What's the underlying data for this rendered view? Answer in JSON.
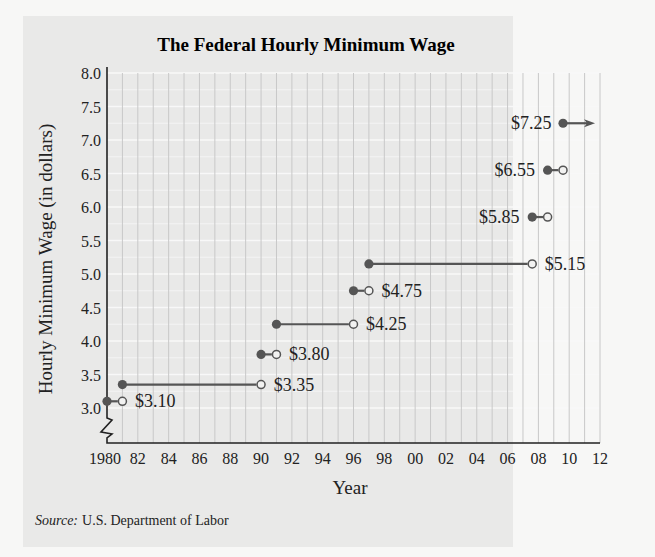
{
  "title": "The Federal Hourly Minimum Wage",
  "y_axis_label": "Hourly Minimum Wage (in dollars)",
  "x_axis_label": "Year",
  "source_label": "Source:",
  "source_text": "U.S. Department of Labor",
  "y_ticks": [
    "8.0",
    "7.5",
    "7.0",
    "6.5",
    "6.0",
    "5.5",
    "5.0",
    "4.5",
    "4.0",
    "3.5",
    "3.0"
  ],
  "x_ticks": [
    "1980",
    "82",
    "84",
    "86",
    "88",
    "90",
    "92",
    "94",
    "96",
    "98",
    "00",
    "02",
    "04",
    "06",
    "08",
    "10",
    "12"
  ],
  "colors": {
    "background": "#e9e9e8",
    "page": "#f7f7f6",
    "line": "#555555",
    "point": "#555555",
    "grid_v": "#c8c8c8",
    "grid_h": "#f8f8f8"
  },
  "chart_data": {
    "type": "line",
    "subtype": "step",
    "title": "The Federal Hourly Minimum Wage",
    "xlabel": "Year",
    "ylabel": "Hourly Minimum Wage (in dollars)",
    "xlim": [
      1980,
      2012
    ],
    "ylim": [
      3.0,
      8.0
    ],
    "y_axis_break": true,
    "grid": {
      "vertical": true,
      "horizontal": true
    },
    "x_tick_labels": [
      "1980",
      "82",
      "84",
      "86",
      "88",
      "90",
      "92",
      "94",
      "96",
      "98",
      "00",
      "02",
      "04",
      "06",
      "08",
      "10",
      "12"
    ],
    "y_tick_labels": [
      "3.0",
      "3.5",
      "4.0",
      "4.5",
      "5.0",
      "5.5",
      "6.0",
      "6.5",
      "7.0",
      "7.5",
      "8.0"
    ],
    "segments": [
      {
        "start": 1980,
        "end": 1981,
        "value": 3.1,
        "label": "$3.10",
        "start_closed": true,
        "end_closed": false
      },
      {
        "start": 1981,
        "end": 1990,
        "value": 3.35,
        "label": "$3.35",
        "start_closed": true,
        "end_closed": false
      },
      {
        "start": 1990,
        "end": 1991,
        "value": 3.8,
        "label": "$3.80",
        "start_closed": true,
        "end_closed": false
      },
      {
        "start": 1991,
        "end": 1996,
        "value": 4.25,
        "label": "$4.25",
        "start_closed": true,
        "end_closed": false
      },
      {
        "start": 1996,
        "end": 1997,
        "value": 4.75,
        "label": "$4.75",
        "start_closed": true,
        "end_closed": false
      },
      {
        "start": 1997,
        "end": 2007.6,
        "value": 5.15,
        "label": "$5.15",
        "start_closed": true,
        "end_closed": false
      },
      {
        "start": 2007.6,
        "end": 2008.6,
        "value": 5.85,
        "label": "$5.85",
        "start_closed": true,
        "end_closed": false
      },
      {
        "start": 2008.6,
        "end": 2009.6,
        "value": 6.55,
        "label": "$6.55",
        "start_closed": true,
        "end_closed": false
      },
      {
        "start": 2009.6,
        "end": null,
        "value": 7.25,
        "label": "$7.25",
        "start_closed": true,
        "end_closed": false,
        "continues": true
      }
    ],
    "source": "Source: U.S. Department of Labor"
  }
}
